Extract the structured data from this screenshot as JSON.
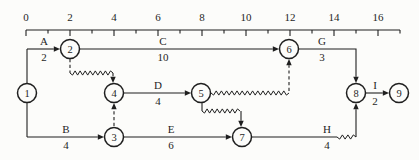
{
  "figure": {
    "width": 419,
    "height": 160,
    "background": "#fcfcfa",
    "ink": "#1f1f1f"
  },
  "ruler": {
    "y": 30,
    "x_start": 26,
    "x_end": 400,
    "units": 17,
    "major_every": 2,
    "major_len": 6,
    "minor_len": 3.5,
    "label_baseline": 21,
    "font_size": 11,
    "labels": [
      {
        "t": 0,
        "text": "0"
      },
      {
        "t": 2,
        "text": "2"
      },
      {
        "t": 4,
        "text": "4"
      },
      {
        "t": 6,
        "text": "6"
      },
      {
        "t": 8,
        "text": "8"
      },
      {
        "t": 10,
        "text": "10"
      },
      {
        "t": 12,
        "text": "12"
      },
      {
        "t": 14,
        "text": "14"
      },
      {
        "t": 16,
        "text": "16"
      }
    ]
  },
  "node_radius": 9.5,
  "node_font_size": 10.5,
  "nodes": [
    {
      "id": "1",
      "x": 27,
      "y": 93
    },
    {
      "id": "2",
      "x": 70,
      "y": 49
    },
    {
      "id": "3",
      "x": 114,
      "y": 137
    },
    {
      "id": "4",
      "x": 114,
      "y": 93
    },
    {
      "id": "5",
      "x": 201,
      "y": 93
    },
    {
      "id": "6",
      "x": 289,
      "y": 49
    },
    {
      "id": "7",
      "x": 242,
      "y": 137
    },
    {
      "id": "8",
      "x": 356,
      "y": 93
    },
    {
      "id": "9",
      "x": 399,
      "y": 93
    }
  ],
  "edges": [
    {
      "id": "spine-node1",
      "type": "solid",
      "points": [
        [
          27,
          49
        ],
        [
          27,
          137
        ]
      ]
    },
    {
      "id": "activity-A-line",
      "type": "solid",
      "arrow": true,
      "points": [
        [
          27,
          49
        ],
        [
          60,
          49
        ]
      ]
    },
    {
      "id": "activity-C-line",
      "type": "solid",
      "arrow": true,
      "points": [
        [
          80,
          49
        ],
        [
          279,
          49
        ]
      ]
    },
    {
      "id": "activity-G-line",
      "type": "solid",
      "arrow": true,
      "points": [
        [
          299,
          49
        ],
        [
          356,
          49
        ],
        [
          356,
          83
        ]
      ]
    },
    {
      "id": "activity-B-line",
      "type": "solid",
      "arrow": true,
      "points": [
        [
          27,
          137
        ],
        [
          104,
          137
        ]
      ]
    },
    {
      "id": "activity-E-line",
      "type": "solid",
      "arrow": true,
      "points": [
        [
          124,
          137
        ],
        [
          232,
          137
        ]
      ]
    },
    {
      "id": "activity-D-line",
      "type": "solid",
      "arrow": true,
      "points": [
        [
          124,
          93
        ],
        [
          191,
          93
        ]
      ]
    },
    {
      "id": "activity-I-line",
      "type": "solid",
      "arrow": true,
      "points": [
        [
          366,
          93
        ],
        [
          389,
          93
        ]
      ]
    },
    {
      "id": "activity-H-line",
      "type": "solid",
      "points": [
        [
          252,
          137
        ],
        [
          337,
          137
        ]
      ]
    },
    {
      "id": "float-H",
      "type": "wavy",
      "points": [
        [
          337,
          137
        ],
        [
          356,
          137
        ]
      ]
    },
    {
      "id": "riser-H-to-8",
      "type": "solid",
      "arrow": true,
      "points": [
        [
          356,
          137
        ],
        [
          356,
          103
        ]
      ]
    },
    {
      "id": "stub-5-down",
      "type": "solid",
      "points": [
        [
          202,
          103
        ],
        [
          202,
          111
        ]
      ]
    },
    {
      "id": "float-5-7",
      "type": "wavy",
      "points": [
        [
          202,
          111
        ],
        [
          240,
          111
        ]
      ]
    },
    {
      "id": "drop-into-7",
      "type": "solid",
      "arrow": true,
      "points": [
        [
          241,
          111
        ],
        [
          241,
          127
        ]
      ]
    },
    {
      "id": "dummy-3-4",
      "type": "dashed",
      "arrow": true,
      "points": [
        [
          114,
          126
        ],
        [
          114,
          103
        ]
      ]
    },
    {
      "id": "stub-2-down",
      "type": "dashed",
      "points": [
        [
          70,
          59
        ],
        [
          70,
          73
        ]
      ]
    },
    {
      "id": "float-2-4",
      "type": "wavy",
      "points": [
        [
          70,
          73
        ],
        [
          113,
          73
        ]
      ]
    },
    {
      "id": "drop-into-4",
      "type": "dashed",
      "arrow": true,
      "points": [
        [
          113,
          73
        ],
        [
          113,
          83
        ]
      ]
    },
    {
      "id": "float-5-6",
      "type": "wavy",
      "points": [
        [
          211,
          93
        ],
        [
          289,
          93
        ]
      ]
    },
    {
      "id": "riser-5-6",
      "type": "dashed",
      "arrow": true,
      "points": [
        [
          289,
          91
        ],
        [
          289,
          59
        ]
      ]
    }
  ],
  "activity_labels": [
    {
      "name": "A",
      "duration": "2",
      "x": 44,
      "line_y": 49
    },
    {
      "name": "C",
      "duration": "10",
      "x": 163,
      "line_y": 49
    },
    {
      "name": "G",
      "duration": "3",
      "x": 322,
      "line_y": 49
    },
    {
      "name": "D",
      "duration": "4",
      "x": 158,
      "line_y": 93
    },
    {
      "name": "I",
      "duration": "2",
      "x": 375,
      "line_y": 93
    },
    {
      "name": "B",
      "duration": "4",
      "x": 66,
      "line_y": 137
    },
    {
      "name": "E",
      "duration": "6",
      "x": 171,
      "line_y": 137
    },
    {
      "name": "H",
      "duration": "4",
      "x": 327,
      "line_y": 137
    }
  ],
  "label_font_size": 11
}
